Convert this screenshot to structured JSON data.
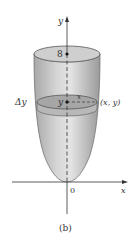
{
  "figure": {
    "caption": "(b)",
    "labels": {
      "y_axis": "y",
      "x_axis": "x",
      "origin": "0",
      "top_value": "8",
      "slice_y": "y",
      "radius": "x",
      "point": "(x, y)",
      "delta_y": "Δy"
    },
    "colors": {
      "solid_fill": "#c8c8c8",
      "solid_light": "#e6e6e6",
      "slab_fill": "#a9a9a9",
      "outline": "#555555",
      "axis": "#333333"
    }
  }
}
